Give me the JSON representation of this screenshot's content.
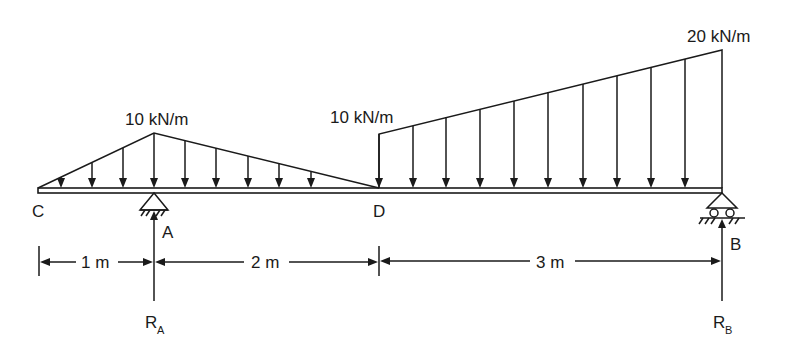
{
  "diagram": {
    "type": "beam-loading",
    "stroke_color": "#1a1a1a",
    "background": "#ffffff",
    "points": {
      "C": {
        "label": "C",
        "x_m": 0
      },
      "A": {
        "label": "A",
        "x_m": 1
      },
      "D": {
        "label": "D",
        "x_m": 3
      },
      "B": {
        "label": "B",
        "x_m": 6
      }
    },
    "loads": [
      {
        "type": "triangular",
        "from": "C",
        "peak": "A",
        "to": "D",
        "peak_label": "10 kN/m"
      },
      {
        "type": "trapezoidal",
        "from": "D",
        "to": "B",
        "start_label": "10 kN/m",
        "end_label": "20 kN/m"
      }
    ],
    "supports": [
      {
        "at": "A",
        "type": "pin",
        "reaction_label": "R",
        "reaction_sub": "A"
      },
      {
        "at": "B",
        "type": "roller",
        "reaction_label": "R",
        "reaction_sub": "B"
      }
    ],
    "dimensions": [
      {
        "from": "C",
        "to": "A",
        "label": "1 m"
      },
      {
        "from": "A",
        "to": "D",
        "label": "2 m"
      },
      {
        "from": "D",
        "to": "B",
        "label": "3 m"
      }
    ]
  }
}
